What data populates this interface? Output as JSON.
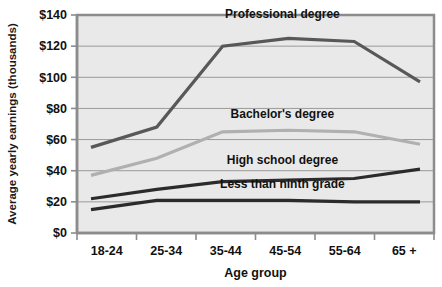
{
  "chart_data": {
    "type": "line",
    "title": "",
    "xlabel": "Age group",
    "ylabel": "Average yearly earnings (thousands)",
    "categories": [
      "18-24",
      "25-34",
      "35-44",
      "45-54",
      "55-64",
      "65 +"
    ],
    "ylim": [
      0,
      140
    ],
    "ytick_step": 20,
    "ytick_labels": [
      "$0",
      "$20",
      "$40",
      "$60",
      "$80",
      "$100",
      "$120",
      "$140"
    ],
    "ytick_values": [
      0,
      20,
      40,
      60,
      80,
      100,
      120,
      140
    ],
    "grid": "horizontal",
    "legend": "inline-labels",
    "plot_background": "#e9e9e9",
    "series": [
      {
        "name": "Professional degree",
        "color": "#585858",
        "width": 3.2,
        "values": [
          55,
          68,
          120,
          125,
          123,
          97
        ],
        "label_x_category_index": 3,
        "label_y_value": 138
      },
      {
        "name": "Bachelor's degree",
        "color": "#b0b0b0",
        "width": 3.2,
        "values": [
          37,
          48,
          65,
          66,
          65,
          57
        ],
        "label_x_category_index": 3,
        "label_y_value": 74
      },
      {
        "name": "High school degree",
        "color": "#2b2b2b",
        "width": 3.2,
        "values": [
          22,
          28,
          33,
          34,
          35,
          41
        ],
        "label_x_category_index": 3,
        "label_y_value": 44
      },
      {
        "name": "Less than ninth grade",
        "color": "#2b2b2b",
        "width": 3.2,
        "values": [
          15,
          21,
          21,
          21,
          20,
          20
        ],
        "label_x_category_index": 3,
        "label_y_value": 29
      }
    ]
  }
}
